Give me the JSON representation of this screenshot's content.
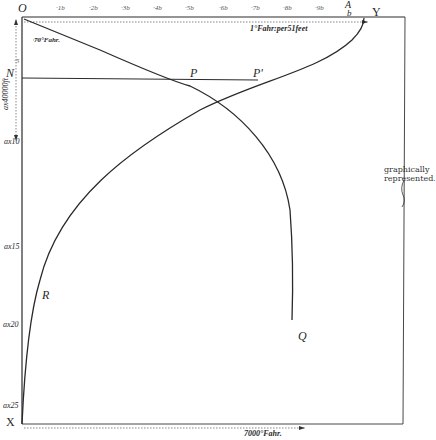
{
  "figure": {
    "origin_label": "O",
    "corner_labels": {
      "A": "A",
      "b": "b",
      "Y": "Y",
      "X": "X",
      "N": "N"
    },
    "top_ticks": [
      "·1",
      "·2",
      "·3",
      "·4",
      "·5",
      "·6",
      "·7",
      "·8",
      "·9"
    ],
    "top_tick_display": [
      "·1b",
      "·2b",
      "·3b",
      "·4b",
      "·5b",
      "·6b",
      "·7b",
      "·8b",
      "·9b"
    ],
    "top_dimension_label": "1°Fahr. per 51 feet",
    "top_dimension_display": "1°Fahr:per51feet",
    "small_label": "70°Fahr.",
    "left_dimension_label": "ax 40000 ft",
    "left_dimension_display": "ax40000ft",
    "left_ticks": [
      "·5",
      "ax10",
      "ax15",
      "ax20",
      "ax25"
    ],
    "point_labels": {
      "P": "P",
      "P_prime": "P'",
      "Q": "Q",
      "R": "R"
    },
    "bottom_dimension_label": "7000°Fahr.",
    "bracket_note_line1": "graphically",
    "bracket_note_line2": "represented."
  },
  "colors": {
    "ink": "#2a2a2a",
    "paper": "#ffffff",
    "dotted": "#555555"
  }
}
